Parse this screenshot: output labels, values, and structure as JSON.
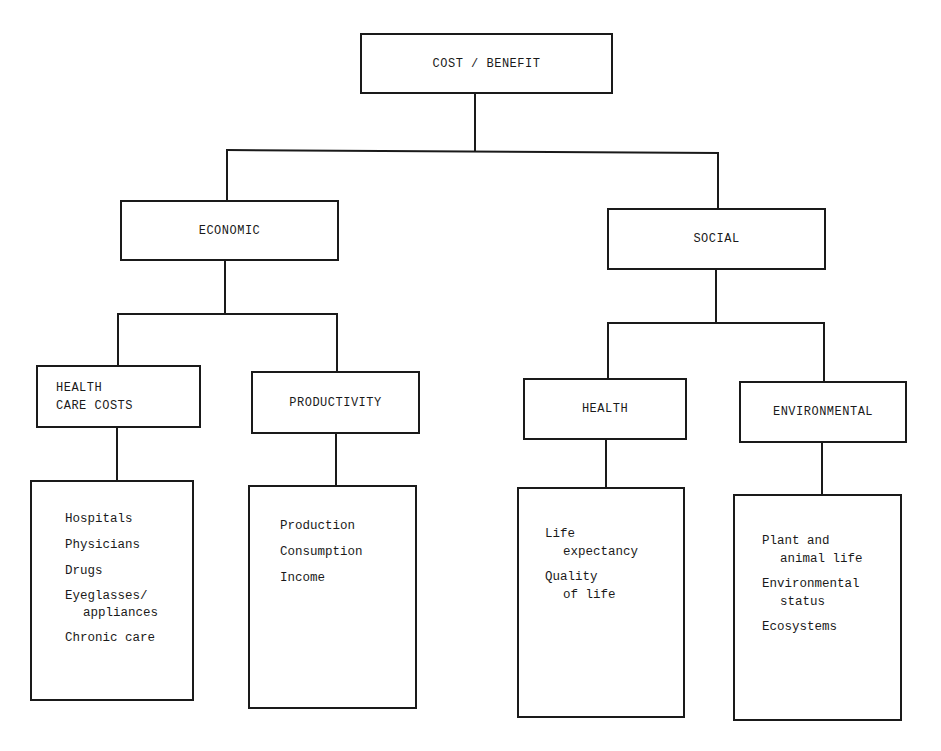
{
  "diagram": {
    "root": {
      "label": "COST / BENEFIT"
    },
    "branches": [
      {
        "label": "ECONOMIC",
        "children": [
          {
            "label": "HEALTH\nCARE COSTS",
            "items": [
              {
                "line1": "Hospitals",
                "line2": ""
              },
              {
                "line1": "Physicians",
                "line2": ""
              },
              {
                "line1": "Drugs",
                "line2": ""
              },
              {
                "line1": "Eyeglasses/",
                "line2": "appliances"
              },
              {
                "line1": "Chronic care",
                "line2": ""
              }
            ]
          },
          {
            "label": "PRODUCTIVITY",
            "items": [
              {
                "line1": "Production",
                "line2": ""
              },
              {
                "line1": "Consumption",
                "line2": ""
              },
              {
                "line1": "Income",
                "line2": ""
              }
            ]
          }
        ]
      },
      {
        "label": "SOCIAL",
        "children": [
          {
            "label": "HEALTH",
            "items": [
              {
                "line1": "Life",
                "line2": "expectancy"
              },
              {
                "line1": "Quality",
                "line2": "of life"
              }
            ]
          },
          {
            "label": "ENVIRONMENTAL",
            "items": [
              {
                "line1": "Plant and",
                "line2": "animal life"
              },
              {
                "line1": "Environmental",
                "line2": "status"
              },
              {
                "line1": "Ecosystems",
                "line2": ""
              }
            ]
          }
        ]
      }
    ],
    "colors": {
      "line": "#1a1a1a",
      "background": "#ffffff"
    }
  }
}
